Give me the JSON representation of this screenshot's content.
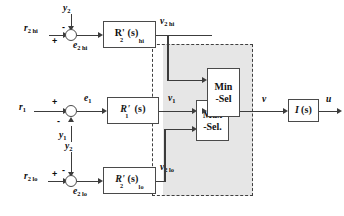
{
  "diagram": {
    "colors": {
      "wire": "#3c3c3c",
      "block_border": "#4a4a4a",
      "shade": "#e6e6e6",
      "dashed_border": "#3f3f3f",
      "text": "#111111"
    },
    "branches": {
      "hi": {
        "reference_label": "r",
        "reference_sub": "2 hi",
        "feedback_label": "y",
        "feedback_sub": "2",
        "error_label": "e",
        "error_sub": "2 hi",
        "controller_label": "R'",
        "controller_sub": "2",
        "controller_sub2": "hi",
        "controller_arg": "(s)",
        "output_label": "v",
        "output_sub": "2 hi",
        "sign_reference": "+",
        "sign_feedback": "-"
      },
      "main": {
        "reference_label": "r",
        "reference_sub": "1",
        "feedback_label": "y",
        "feedback_sub": "1",
        "error_label": "e",
        "error_sub": "1",
        "controller_label": "R'",
        "controller_sub": "1",
        "controller_arg": "(s)",
        "output_label": "v",
        "output_sub": "1",
        "sign_reference": "+",
        "sign_feedback": "-"
      },
      "lo": {
        "reference_label": "r",
        "reference_sub": "2 lo",
        "feedback_label": "y",
        "feedback_sub": "2",
        "error_label": "e",
        "error_sub": "2 lo",
        "controller_label": "R'",
        "controller_sub": "2",
        "controller_sub2": "lo",
        "controller_arg": "(s)",
        "output_label": "v",
        "output_sub": "2 lo",
        "sign_reference": "+",
        "sign_feedback": "-"
      }
    },
    "selectors": {
      "min": {
        "line1": "Min",
        "line2": "-Sel"
      },
      "max": {
        "line1": "Max",
        "line2": "-Sel."
      }
    },
    "plant": {
      "label": "I",
      "arg": "(s)",
      "input_label": "v",
      "output_label": "u"
    }
  }
}
